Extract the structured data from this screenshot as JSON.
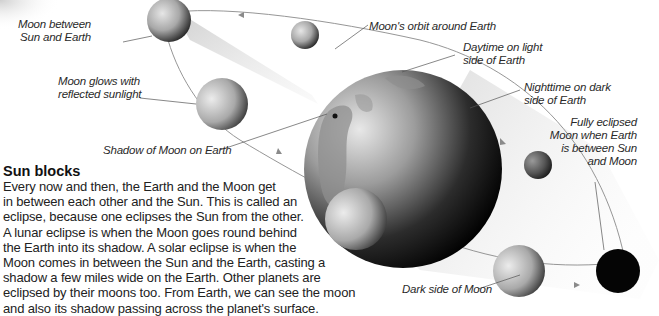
{
  "labels": {
    "moon_between": [
      "Moon between",
      "Sun and Earth"
    ],
    "orbit": "Moon's orbit around Earth",
    "daytime": [
      "Daytime on light",
      "side of Earth"
    ],
    "nighttime": [
      "Nighttime on dark",
      "side of Earth"
    ],
    "glows": [
      "Moon glows with",
      "reflected sunlight"
    ],
    "shadow": "Shadow of Moon on Earth",
    "fully_eclipsed": [
      "Fully eclipsed",
      "Moon when Earth",
      "is between Sun",
      "and Moon"
    ],
    "dark_side": "Dark side of Moon"
  },
  "article": {
    "heading": "Sun blocks",
    "lines": [
      "Every now and then, the Earth and the Moon get",
      "in between each other and the Sun. This is called an",
      "eclipse, because one eclipses the Sun from the other.",
      "A lunar eclipse is when the Moon goes round behind",
      "the Earth into its shadow. A solar eclipse is when the",
      "Moon comes in between the Sun and the Earth, casting a",
      "shadow a few miles wide on the Earth. Other planets are",
      "eclipsed by their moons too. From Earth, we can see the moon",
      "and also its shadow passing across the planet's surface."
    ]
  },
  "colors": {
    "background": "#ffffff",
    "orbit_line": "#8a8a8a",
    "shadow_cone": "#d8d8d8",
    "text": "#222222"
  }
}
